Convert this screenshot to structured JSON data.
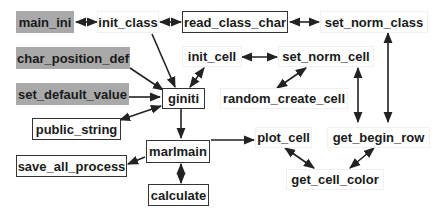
{
  "diagram": {
    "nodes": {
      "main_ini": "main_ini",
      "init_class": "init_class",
      "read_class_char": "read_class_char",
      "set_norm_class": "set_norm_class",
      "char_position_def": "char_position_def",
      "init_cell": "init_cell",
      "set_norm_cell": "set_norm_cell",
      "set_default_value": "set_default_value",
      "giniti": "giniti",
      "random_create_cell": "random_create_cell",
      "public_string": "public_string",
      "marlmain": "marlmain",
      "plot_cell": "plot_cell",
      "get_begin_row": "get_begin_row",
      "save_all_process": "save_all_process",
      "get_cell_color": "get_cell_color",
      "calculate": "calculate"
    },
    "styles": {
      "gray_fill": "#a9a9a9",
      "border": "#333333",
      "arrow": "#222222"
    },
    "edges": [
      {
        "from": "main_ini",
        "to": "init_class",
        "type": "bidirectional"
      },
      {
        "from": "init_class",
        "to": "read_class_char",
        "type": "bidirectional"
      },
      {
        "from": "read_class_char",
        "to": "set_norm_class",
        "type": "bidirectional"
      },
      {
        "from": "init_class",
        "to": "giniti",
        "type": "directed"
      },
      {
        "from": "char_position_def",
        "to": "giniti",
        "type": "directed"
      },
      {
        "from": "set_default_value",
        "to": "giniti",
        "type": "directed"
      },
      {
        "from": "giniti",
        "to": "init_cell",
        "type": "bidirectional"
      },
      {
        "from": "init_cell",
        "to": "set_norm_cell",
        "type": "bidirectional"
      },
      {
        "from": "set_norm_cell",
        "to": "random_create_cell",
        "type": "bidirectional"
      },
      {
        "from": "giniti",
        "to": "public_string",
        "type": "bidirectional"
      },
      {
        "from": "giniti",
        "to": "marlmain",
        "type": "directed"
      },
      {
        "from": "marlmain",
        "to": "save_all_process",
        "type": "directed"
      },
      {
        "from": "marlmain",
        "to": "calculate",
        "type": "bidirectional"
      },
      {
        "from": "marlmain",
        "to": "plot_cell",
        "type": "directed"
      },
      {
        "from": "set_norm_cell",
        "to": "get_begin_row",
        "type": "bidirectional"
      },
      {
        "from": "set_norm_class",
        "to": "get_begin_row",
        "type": "bidirectional"
      },
      {
        "from": "plot_cell",
        "to": "get_cell_color",
        "type": "bidirectional"
      },
      {
        "from": "get_begin_row",
        "to": "get_cell_color",
        "type": "bidirectional"
      }
    ]
  }
}
